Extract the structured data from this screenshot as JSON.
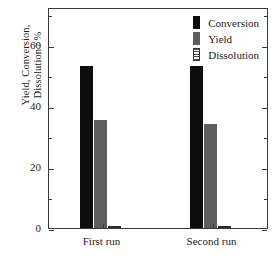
{
  "chart_data": {
    "type": "bar",
    "title": "",
    "xlabel": "",
    "ylabel": "Yield, Conversion, Dissolution / %",
    "ylabel_lines": [
      "Yield, Conversion,",
      "Dissolution / %"
    ],
    "categories": [
      "First run",
      "Second run"
    ],
    "series": [
      {
        "name": "Conversion",
        "color": "#0d0d0d",
        "values": [
          53.0,
          53.0
        ]
      },
      {
        "name": "Yield",
        "color": "#5e5e5e",
        "values": [
          35.5,
          34.0
        ]
      },
      {
        "name": "Dissolution",
        "color": "#2a2a2a",
        "values": [
          0.5,
          0.6
        ]
      }
    ],
    "ylim": [
      0,
      72.5
    ],
    "yticks": [
      0,
      20,
      40,
      60
    ],
    "ytick_labels": [
      "0",
      "20",
      "40",
      "60"
    ],
    "yminor_ticks": [
      10,
      30,
      50,
      70
    ],
    "grid": false,
    "legend_position": "top-right",
    "legend_entries": [
      "Conversion",
      "Yield",
      "Dissolution"
    ]
  },
  "axis": {
    "frame_color": "#3a3a3a",
    "background": "#ffffff"
  }
}
